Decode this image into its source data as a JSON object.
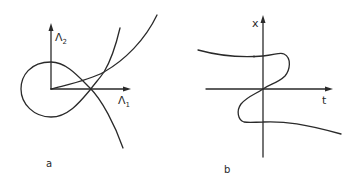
{
  "figure": {
    "panels": [
      {
        "id": "a",
        "panel_label": "a",
        "x_axis": {
          "symbol": "Λ",
          "subscript": "1"
        },
        "y_axis": {
          "symbol": "Λ",
          "subscript": "2"
        },
        "curves": [
          "loop curve passing around origin and self-intersecting on the Λ1 axis",
          "steep rising curve",
          "shallow rising curve starting at origin"
        ]
      },
      {
        "id": "b",
        "panel_label": "b",
        "x_axis": {
          "symbol": "t"
        },
        "y_axis": {
          "symbol": "x"
        },
        "curves": [
          "S-shaped (Z-shaped) curve passing through origin with folds above and below the t axis"
        ]
      }
    ],
    "stroke_color": "#2a2a2a",
    "background": "#ffffff"
  }
}
